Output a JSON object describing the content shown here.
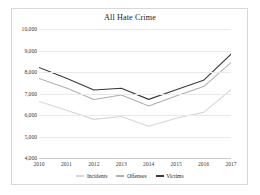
{
  "chart_data": {
    "type": "line",
    "title": "All Hate Crime",
    "xlabel": "",
    "ylabel": "",
    "x": [
      "2010",
      "2011",
      "2012",
      "2013",
      "2014",
      "2015",
      "2016",
      "2017"
    ],
    "categories": [
      "2010",
      "2011",
      "2012",
      "2013",
      "2014",
      "2015",
      "2016",
      "2017"
    ],
    "ylim": [
      4000,
      10000
    ],
    "ytick_labels": [
      "4,000",
      "5,000",
      "6,000",
      "7,000",
      "8,000",
      "9,000",
      "10,000"
    ],
    "ytick_values": [
      4000,
      5000,
      6000,
      7000,
      8000,
      9000,
      10000
    ],
    "grid": true,
    "legend_position": "bottom",
    "series": [
      {
        "name": "Incidents",
        "color": "#d6d6d6",
        "values": [
          6628,
          6222,
          5796,
          5928,
          5479,
          5850,
          6121,
          7175
        ]
      },
      {
        "name": "Offenses",
        "color": "#b0b0b0",
        "values": [
          7699,
          7254,
          6718,
          6933,
          6418,
          6885,
          7321,
          8437
        ]
      },
      {
        "name": "Victims",
        "color": "#3a3a3a",
        "values": [
          8208,
          7713,
          7164,
          7242,
          6727,
          7173,
          7615,
          8828
        ]
      }
    ]
  },
  "legend": {
    "items": [
      {
        "label": "Incidents"
      },
      {
        "label": "Offenses"
      },
      {
        "label": "Victims"
      }
    ]
  }
}
